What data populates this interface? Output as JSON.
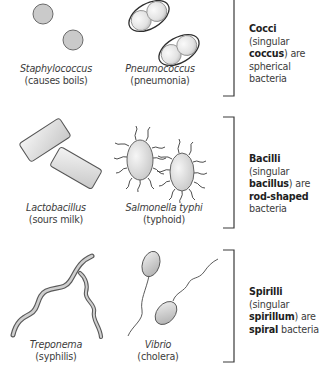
{
  "groups": [
    {
      "name": "cocci",
      "description": {
        "term": "Cocci",
        "paren_open": " (singular ",
        "singular": "coccus",
        "paren_close": ") are spherical bacteria"
      },
      "examples": [
        {
          "scientific_name": "Staphylococcus",
          "disease": "(causes boils)"
        },
        {
          "scientific_name": "Pneumococcus",
          "disease": "(pneumonia)"
        }
      ]
    },
    {
      "name": "bacilli",
      "description": {
        "term": "Bacilli",
        "paren_open": " (singular ",
        "singular": "bacillus",
        "paren_close": ") are ",
        "shape": "rod-shaped",
        "suffix": " bacteria"
      },
      "examples": [
        {
          "scientific_name": "Lactobacillus",
          "disease": "(sours milk)"
        },
        {
          "scientific_name": "Salmonella typhi",
          "disease": "(typhoid)"
        }
      ]
    },
    {
      "name": "spirilli",
      "description": {
        "term": "Spirilli",
        "paren_open": " (singular ",
        "singular": "spirillum",
        "paren_close": ") are ",
        "shape": "spiral",
        "suffix": " bacteria"
      },
      "examples": [
        {
          "scientific_name": "Treponema",
          "disease": "(syphilis)"
        },
        {
          "scientific_name": "Vibrio",
          "disease": "(cholera)"
        }
      ]
    }
  ],
  "colors": {
    "cell_fill": "#c9c9c9",
    "cell_outline": "#4a4a4a",
    "bracket": "#3a3a3a"
  }
}
